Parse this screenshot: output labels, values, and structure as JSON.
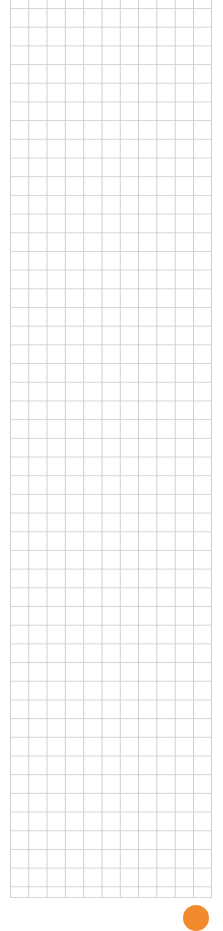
{
  "canvas": {
    "type": "grid-paper",
    "cell_size_px": 18.5,
    "line_color": "#d0d0d0",
    "background": "#ffffff"
  },
  "action_button": {
    "color": "#f08a2c",
    "icon": "circle"
  }
}
